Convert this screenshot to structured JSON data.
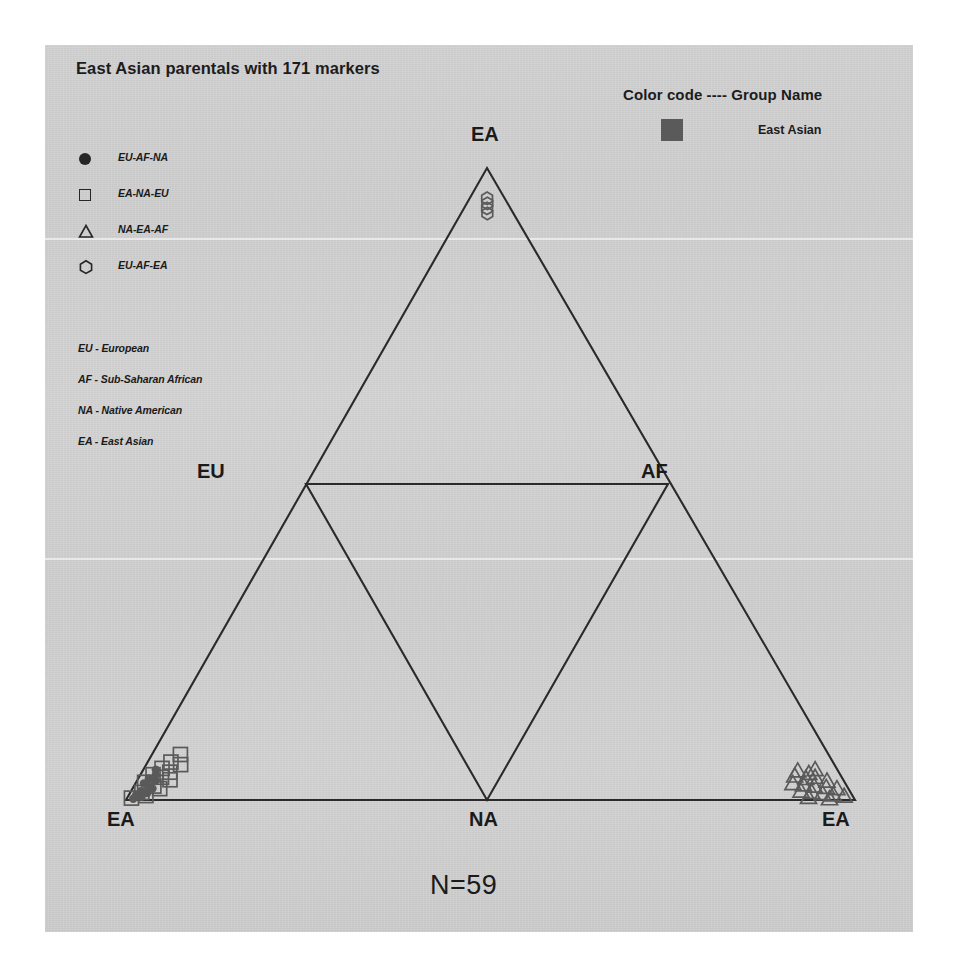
{
  "figure": {
    "title": "East Asian parentals with 171 markers",
    "sample_caption": "N=59"
  },
  "shape_legend": {
    "items": [
      {
        "glyph": "filled-circle",
        "label": "EU-AF-NA"
      },
      {
        "glyph": "open-square",
        "label": "EA-NA-EU"
      },
      {
        "glyph": "open-triangle",
        "label": "NA-EA-AF"
      },
      {
        "glyph": "open-hexagon",
        "label": "EU-AF-EA"
      }
    ]
  },
  "abbreviation_key": {
    "items": [
      "EU - European",
      "AF - Sub-Saharan African",
      "NA - Native American",
      "EA - East Asian"
    ]
  },
  "color_legend": {
    "title": "Color code ---- Group Name",
    "rows": [
      {
        "color": "#5a5a5a",
        "label": "East Asian"
      }
    ]
  },
  "vertex_labels": {
    "apex": "EA",
    "left_mid": "EU",
    "right_mid": "AF",
    "bottom_left": "EA",
    "bottom_center": "NA",
    "bottom_right": "EA"
  },
  "chart_data": {
    "type": "scatter",
    "title": "East Asian parentals with 171 markers",
    "subtitle": "N=59",
    "plot_style": "ternary-sierpinski-triangle",
    "xlabel": "",
    "ylabel": "",
    "grid": false,
    "legend_position": "top-right",
    "axis_vertices": [
      {
        "name": "EA",
        "position": "apex"
      },
      {
        "name": "EU",
        "position": "left-midpoint"
      },
      {
        "name": "AF",
        "position": "right-midpoint"
      },
      {
        "name": "EA",
        "position": "bottom-left"
      },
      {
        "name": "NA",
        "position": "bottom-center"
      },
      {
        "name": "EA",
        "position": "bottom-right"
      }
    ],
    "group_color": "#5a5a5a",
    "group_name": "East Asian",
    "total_points": 59,
    "series": [
      {
        "name": "EU-AF-NA",
        "marker": "filled-circle",
        "cluster": "bottom-left-vertex",
        "count": 12,
        "points": [
          [
            0.018,
            0.048
          ],
          [
            0.022,
            0.04
          ],
          [
            0.015,
            0.034
          ],
          [
            0.026,
            0.03
          ],
          [
            0.012,
            0.026
          ],
          [
            0.02,
            0.022
          ],
          [
            0.028,
            0.018
          ],
          [
            0.014,
            0.014
          ],
          [
            0.024,
            0.011
          ],
          [
            0.01,
            0.008
          ],
          [
            0.019,
            0.005
          ],
          [
            0.009,
            0.002
          ]
        ]
      },
      {
        "name": "EA-NA-EU",
        "marker": "open-square",
        "cluster": "bottom-left-vertex",
        "count": 14,
        "points": [
          [
            0.042,
            0.072
          ],
          [
            0.034,
            0.06
          ],
          [
            0.05,
            0.056
          ],
          [
            0.026,
            0.05
          ],
          [
            0.04,
            0.044
          ],
          [
            0.018,
            0.04
          ],
          [
            0.032,
            0.036
          ],
          [
            0.046,
            0.032
          ],
          [
            0.012,
            0.028
          ],
          [
            0.028,
            0.022
          ],
          [
            0.038,
            0.018
          ],
          [
            0.016,
            0.012
          ],
          [
            0.024,
            0.007
          ],
          [
            0.006,
            0.003
          ]
        ]
      },
      {
        "name": "NA-EA-AF",
        "marker": "open-triangle",
        "cluster": "bottom-right-vertex",
        "count": 19,
        "points": [
          [
            0.942,
            0.046
          ],
          [
            0.956,
            0.042
          ],
          [
            0.968,
            0.048
          ],
          [
            0.934,
            0.038
          ],
          [
            0.948,
            0.034
          ],
          [
            0.962,
            0.036
          ],
          [
            0.976,
            0.03
          ],
          [
            0.926,
            0.026
          ],
          [
            0.94,
            0.024
          ],
          [
            0.954,
            0.022
          ],
          [
            0.97,
            0.02
          ],
          [
            0.984,
            0.018
          ],
          [
            0.932,
            0.014
          ],
          [
            0.946,
            0.012
          ],
          [
            0.96,
            0.01
          ],
          [
            0.974,
            0.008
          ],
          [
            0.988,
            0.006
          ],
          [
            0.938,
            0.004
          ],
          [
            0.966,
            0.002
          ]
        ]
      },
      {
        "name": "EU-AF-EA",
        "marker": "open-hexagon",
        "cluster": "apex",
        "count": 4,
        "points": [
          [
            0.498,
            0.952
          ],
          [
            0.504,
            0.944
          ],
          [
            0.496,
            0.936
          ],
          [
            0.502,
            0.928
          ]
        ]
      }
    ]
  }
}
